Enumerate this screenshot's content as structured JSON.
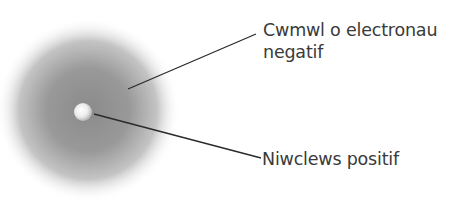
{
  "diagram": {
    "type": "atom-model",
    "labels": {
      "cloud": {
        "line1": "Cwmwl o electronau",
        "line2": "negatif"
      },
      "nucleus": "Niwclews positif"
    },
    "colors": {
      "cloud_center": "#8c8c8c",
      "cloud_edge": "#ffffff",
      "nucleus": "#f2f2f2",
      "leader_line": "#2a2a2a",
      "text": "#3a3a3a"
    }
  }
}
